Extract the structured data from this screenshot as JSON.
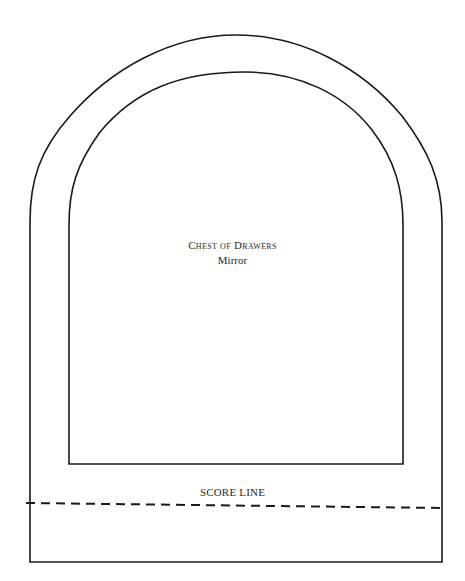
{
  "diagram": {
    "type": "cutting-template",
    "title": "Chest of Drawers",
    "subtitle": "Mirror",
    "score_line_label": "SCORE LINE",
    "colors": {
      "line": "#1a1a1a",
      "background": "#ffffff",
      "text": "#2a2a2a"
    },
    "shapes": {
      "outer_frame": {
        "left": 30,
        "right": 442,
        "arch_top": 35,
        "bottom": 562,
        "shape": "round-top arch"
      },
      "inner_opening": {
        "left": 69,
        "right": 403,
        "arch_top": 72,
        "bottom": 464,
        "shape": "round-top arch"
      },
      "score_line": {
        "y": 503,
        "style": "dashed",
        "from_x": 26,
        "to_x": 442
      }
    }
  }
}
